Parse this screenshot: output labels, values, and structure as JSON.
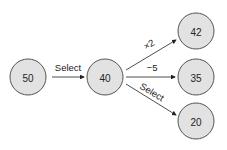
{
  "nodes": [
    {
      "id": "n50",
      "value": "50"
    },
    {
      "id": "n40",
      "value": "40"
    },
    {
      "id": "n42",
      "value": "42"
    },
    {
      "id": "n35",
      "value": "35"
    },
    {
      "id": "n20",
      "value": "20"
    }
  ],
  "edges": [
    {
      "from": "50",
      "to": "40",
      "label": "Select"
    },
    {
      "from": "40",
      "to": "42",
      "label": "×2"
    },
    {
      "from": "40",
      "to": "35",
      "label": "−5"
    },
    {
      "from": "40",
      "to": "20",
      "label": "Select"
    }
  ]
}
